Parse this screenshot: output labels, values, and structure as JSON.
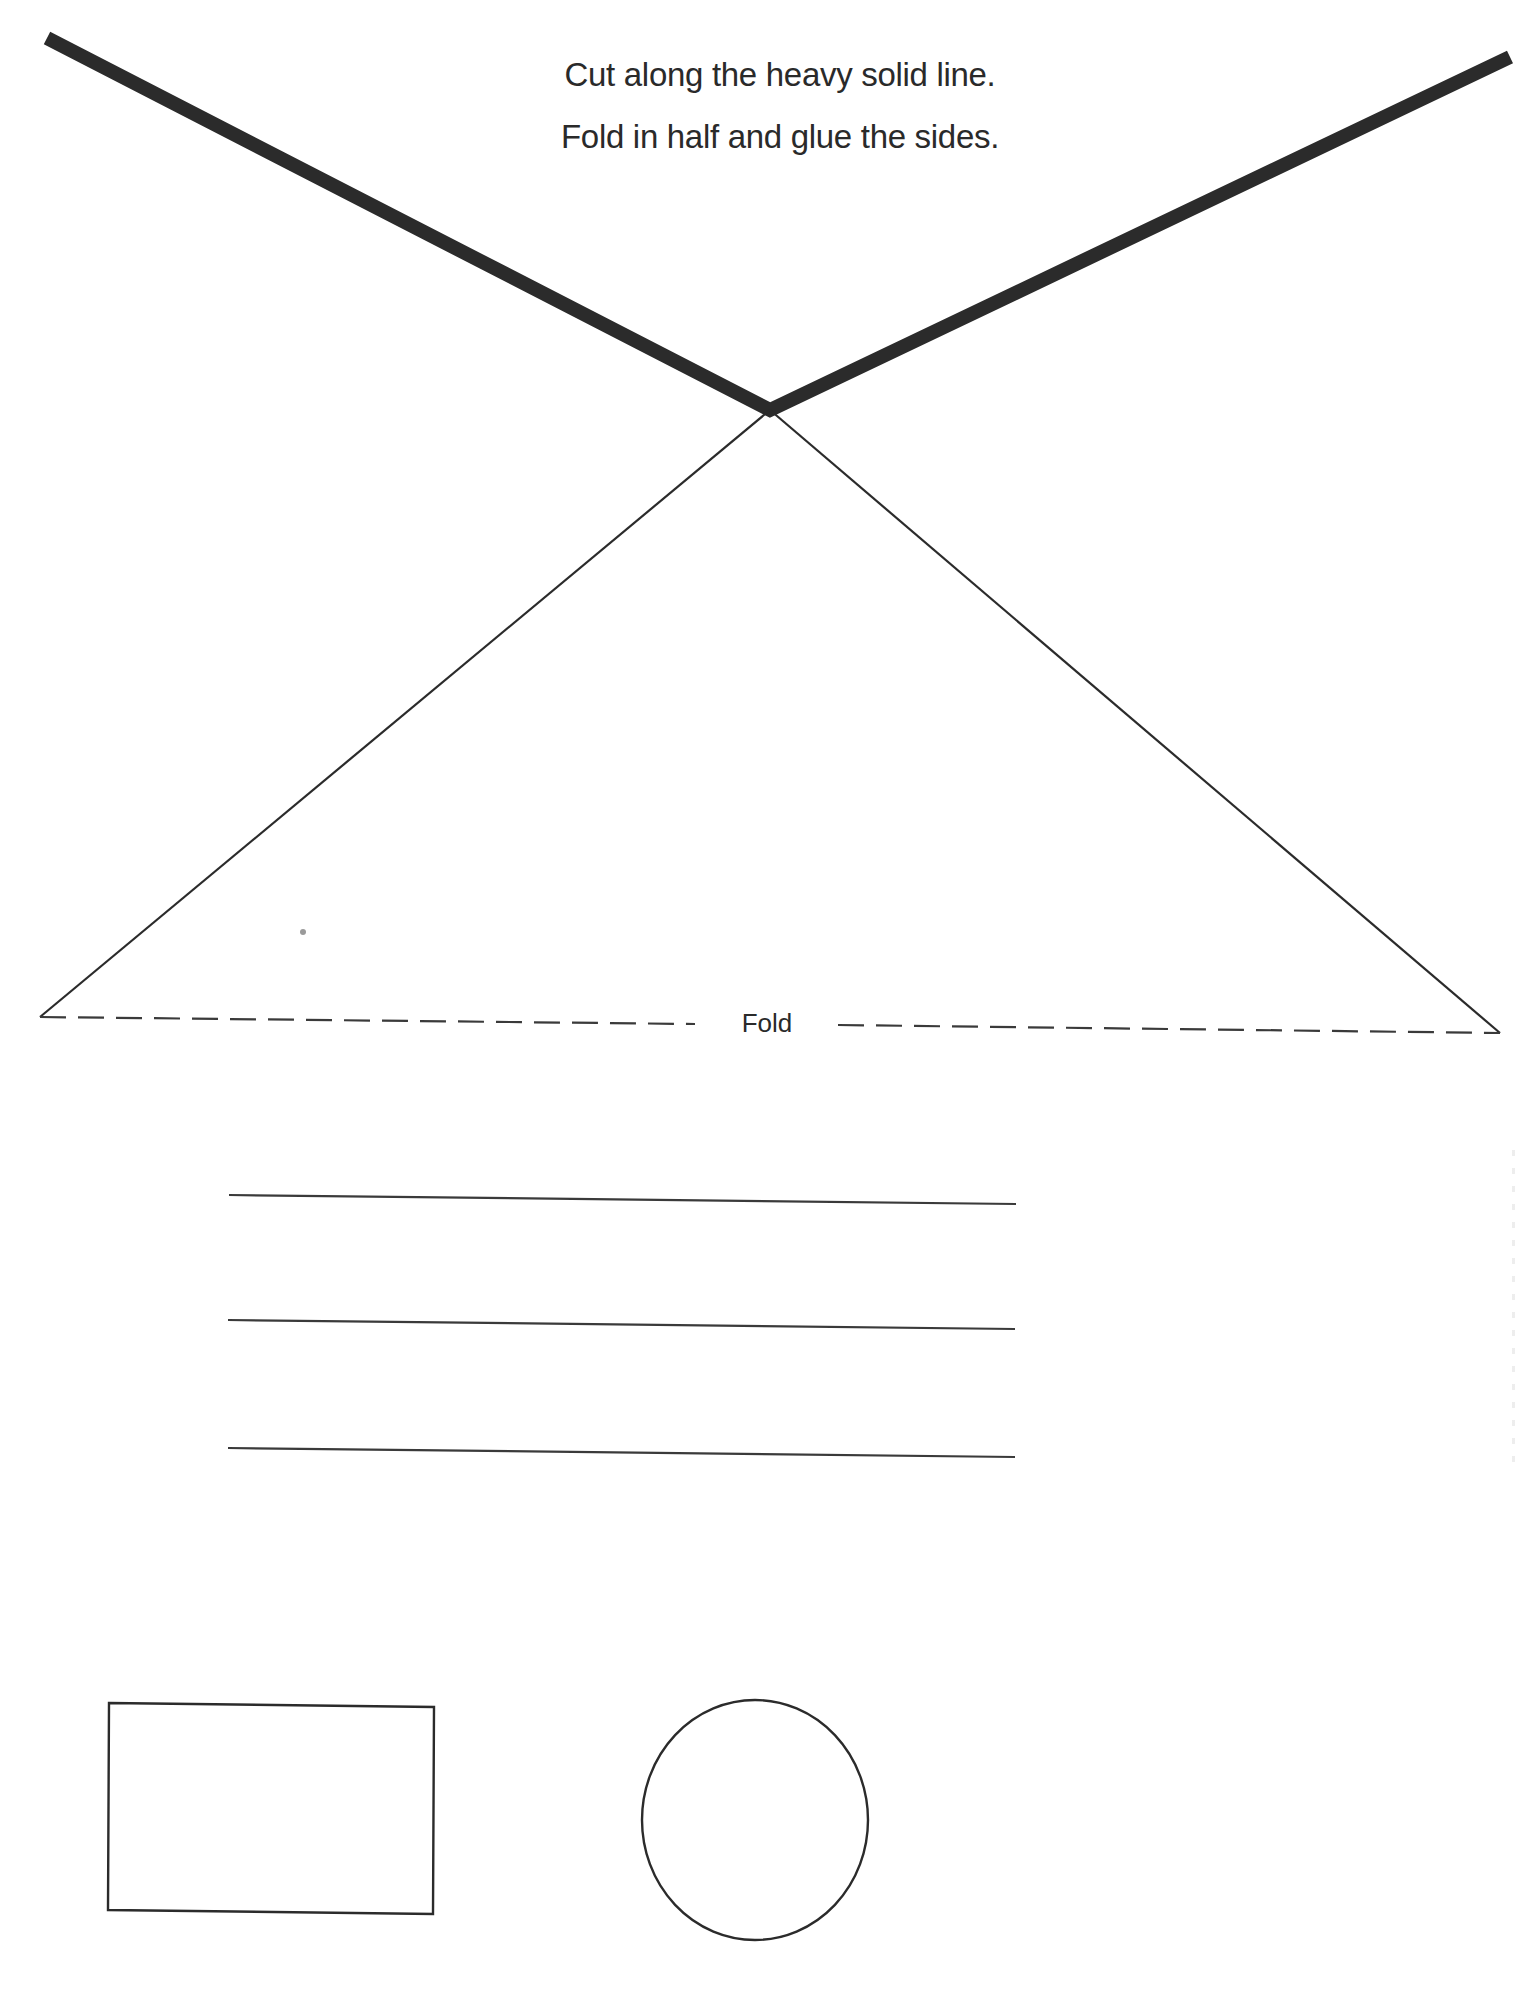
{
  "instructions": {
    "line1": "Cut along the heavy solid line.",
    "line2": "Fold in half and glue the sides."
  },
  "fold": {
    "label": "Fold"
  },
  "shapes": {
    "cut_line": {
      "stroke": "#2b2b2b",
      "points": [
        [
          47,
          38
        ],
        [
          770,
          410
        ],
        [
          1510,
          57
        ]
      ],
      "width": 14
    },
    "triangle": {
      "stroke": "#2b2b2b",
      "apex": [
        770,
        410
      ],
      "left": [
        40,
        1017
      ],
      "right": [
        1500,
        1033
      ],
      "width": 2.2
    },
    "fold_line": {
      "stroke": "#3a3a3a",
      "dash": "26 12",
      "width": 2.2
    },
    "writing_lines": [
      {
        "x1": 229,
        "y1": 1195,
        "x2": 1016,
        "y2": 1204
      },
      {
        "x1": 228,
        "y1": 1320,
        "x2": 1015,
        "y2": 1329
      },
      {
        "x1": 228,
        "y1": 1448,
        "x2": 1015,
        "y2": 1457
      }
    ],
    "rectangle": {
      "x": 108,
      "y": 1703,
      "w": 326,
      "h": 211
    },
    "ellipse": {
      "cx": 755,
      "cy": 1820,
      "rx": 113,
      "ry": 120
    }
  }
}
